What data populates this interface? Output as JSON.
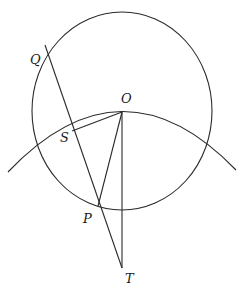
{
  "figure": {
    "type": "geometry-diagram",
    "stroke_color": "#2a2a2a",
    "background": "#ffffff"
  },
  "points": {
    "O": {
      "label": "O",
      "x": 122,
      "y": 112,
      "label_x": 121,
      "label_y": 103
    },
    "Q": {
      "label": "Q",
      "x": 45,
      "y": 60,
      "label_x": 30,
      "label_y": 64
    },
    "S": {
      "label": "S",
      "x": 69,
      "y": 131,
      "label_x": 60,
      "label_y": 142
    },
    "P": {
      "label": "P",
      "x": 98,
      "y": 206,
      "label_x": 83,
      "label_y": 223
    },
    "T": {
      "label": "T",
      "x": 122,
      "y": 268,
      "label_x": 125,
      "label_y": 283
    }
  },
  "shapes": {
    "small_circle": {
      "name": "circle",
      "cx": 122,
      "cy": 111,
      "r": 90
    },
    "large_arc": {
      "name": "arc",
      "from": [
        8,
        172
      ],
      "apex": [
        122,
        112
      ],
      "to": [
        236,
        170
      ]
    },
    "segments": [
      {
        "name": "line-QT",
        "from": [
          45,
          45
        ],
        "to": [
          122,
          268
        ]
      },
      {
        "name": "segment-OS",
        "from": [
          122,
          112
        ],
        "to": [
          72,
          131
        ]
      },
      {
        "name": "segment-OP",
        "from": [
          122,
          112
        ],
        "to": [
          98,
          206
        ]
      },
      {
        "name": "segment-OT",
        "from": [
          122,
          112
        ],
        "to": [
          122,
          268
        ]
      }
    ]
  }
}
